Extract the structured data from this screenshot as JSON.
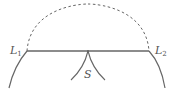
{
  "diagram": {
    "labels": {
      "l1": {
        "main": "L",
        "sub": "1"
      },
      "l2": {
        "main": "L",
        "sub": "2"
      },
      "s": "S"
    },
    "colors": {
      "stroke": "#666666",
      "text": "#555555",
      "background": "#ffffff"
    },
    "elements": [
      "solid horizontal segment from L1 to L2",
      "dashed semicircular arc above segment connecting L1 and L2",
      "solid curve descending left from L1",
      "solid curve descending right from L2",
      "two cusp curves meeting at midpoint of segment above label S"
    ]
  }
}
